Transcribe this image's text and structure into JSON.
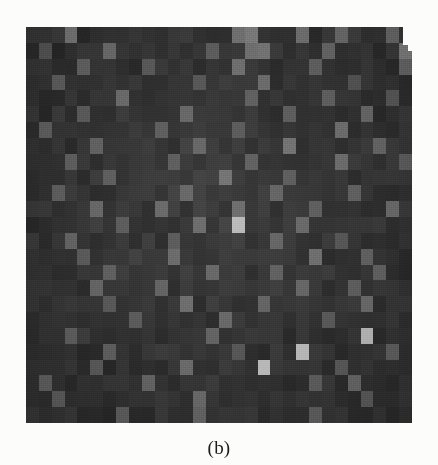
{
  "figure": {
    "caption": "(b)",
    "panel_label": "b",
    "background_color": "#fcfcfa"
  },
  "heatmap": {
    "title": "",
    "xlabel": "",
    "ylabel": "",
    "background_color": "#333333",
    "colormap": "grayscale",
    "panel_left_px": 26,
    "panel_top_px": 27,
    "panel_width_px": 386,
    "panel_height_px": 396
  },
  "chart_data": {
    "type": "heatmap",
    "title": "",
    "subtitle": "",
    "xlabel": "",
    "ylabel": "",
    "grid": false,
    "legend": "none",
    "colormap": "gray",
    "vmin": 0,
    "vmax": 255,
    "n_cols": 30,
    "n_rows": 25,
    "x_tick_labels": [],
    "y_tick_labels": [],
    "annotations": [],
    "note_features": [
      "dark uniform background with scanner grain",
      "scattered mid-gray activation cells",
      "bright descending staircase of 4 cells in lower-right quadrant",
      "white notch cut from the top-right corner of the scanned panel"
    ],
    "values": [
      [
        52,
        50,
        55,
        112,
        48,
        54,
        49,
        51,
        58,
        50,
        47,
        53,
        56,
        49,
        51,
        54,
        112,
        131,
        50,
        48,
        56,
        118,
        49,
        52,
        112,
        58,
        50,
        49,
        111,
        53
      ],
      [
        50,
        92,
        48,
        55,
        51,
        49,
        104,
        52,
        47,
        53,
        50,
        56,
        49,
        51,
        96,
        48,
        53,
        117,
        124,
        51,
        47,
        55,
        50,
        104,
        49,
        53,
        51,
        48,
        55,
        120
      ],
      [
        54,
        48,
        53,
        50,
        106,
        55,
        49,
        51,
        47,
        96,
        52,
        50,
        55,
        48,
        51,
        53,
        110,
        49,
        52,
        47,
        56,
        50,
        98,
        54,
        51,
        48,
        53,
        50,
        49,
        105
      ],
      [
        49,
        56,
        100,
        51,
        48,
        53,
        50,
        47,
        55,
        49,
        52,
        51,
        48,
        94,
        50,
        54,
        49,
        51,
        104,
        48,
        52,
        55,
        50,
        47,
        53,
        92,
        51,
        49,
        54,
        50
      ],
      [
        53,
        50,
        47,
        55,
        51,
        49,
        54,
        108,
        50,
        48,
        52,
        55,
        49,
        51,
        47,
        53,
        50,
        98,
        51,
        54,
        48,
        50,
        55,
        102,
        49,
        51,
        47,
        53,
        96,
        50
      ],
      [
        51,
        48,
        55,
        50,
        94,
        53,
        49,
        51,
        47,
        54,
        50,
        52,
        106,
        48,
        51,
        55,
        49,
        53,
        50,
        47,
        96,
        51,
        48,
        54,
        50,
        52,
        108,
        49,
        51,
        55
      ],
      [
        48,
        104,
        51,
        49,
        54,
        50,
        52,
        47,
        55,
        51,
        98,
        49,
        53,
        50,
        48,
        51,
        94,
        55,
        49,
        52,
        50,
        47,
        53,
        51,
        106,
        48,
        50,
        54,
        49,
        51
      ],
      [
        55,
        49,
        52,
        47,
        51,
        96,
        50,
        53,
        48,
        54,
        51,
        49,
        55,
        102,
        52,
        47,
        50,
        51,
        48,
        54,
        112,
        49,
        53,
        50,
        47,
        51,
        55,
        98,
        52,
        49
      ],
      [
        50,
        53,
        48,
        104,
        55,
        51,
        47,
        49,
        52,
        50,
        54,
        98,
        51,
        48,
        55,
        50,
        49,
        94,
        53,
        51,
        47,
        52,
        50,
        48,
        104,
        55,
        49,
        51,
        53,
        100
      ],
      [
        52,
        47,
        51,
        50,
        48,
        54,
        96,
        51,
        49,
        55,
        50,
        52,
        47,
        53,
        51,
        108,
        48,
        50,
        54,
        49,
        100,
        51,
        55,
        47,
        52,
        50,
        48,
        53,
        51,
        49
      ],
      [
        49,
        51,
        94,
        55,
        52,
        48,
        50,
        47,
        53,
        51,
        49,
        55,
        104,
        50,
        48,
        52,
        51,
        47,
        49,
        96,
        53,
        50,
        55,
        51,
        48,
        106,
        52,
        49,
        50,
        47
      ],
      [
        51,
        55,
        50,
        48,
        53,
        102,
        49,
        52,
        47,
        50,
        96,
        51,
        48,
        55,
        53,
        49,
        110,
        52,
        50,
        47,
        51,
        48,
        98,
        53,
        55,
        50,
        49,
        51,
        104,
        52
      ],
      [
        47,
        50,
        53,
        51,
        49,
        55,
        48,
        96,
        52,
        50,
        51,
        47,
        53,
        108,
        49,
        52,
        190,
        50,
        55,
        48,
        51,
        98,
        50,
        53,
        47,
        49,
        51,
        55,
        50,
        48
      ],
      [
        53,
        48,
        51,
        104,
        50,
        47,
        55,
        51,
        49,
        52,
        48,
        94,
        50,
        51,
        55,
        49,
        53,
        47,
        52,
        106,
        50,
        48,
        51,
        55,
        96,
        52,
        49,
        51,
        47,
        50
      ],
      [
        50,
        52,
        47,
        51,
        98,
        53,
        49,
        50,
        55,
        48,
        51,
        104,
        52,
        47,
        50,
        51,
        49,
        55,
        48,
        53,
        51,
        50,
        110,
        47,
        52,
        49,
        96,
        51,
        55,
        50
      ],
      [
        55,
        49,
        51,
        50,
        52,
        47,
        94,
        53,
        48,
        51,
        49,
        50,
        55,
        52,
        106,
        48,
        51,
        47,
        50,
        96,
        53,
        49,
        52,
        51,
        55,
        50,
        48,
        104,
        51,
        47
      ],
      [
        48,
        51,
        55,
        47,
        50,
        104,
        52,
        49,
        51,
        53,
        98,
        47,
        50,
        55,
        48,
        51,
        52,
        49,
        50,
        53,
        47,
        102,
        51,
        48,
        55,
        96,
        50,
        52,
        49,
        51
      ],
      [
        51,
        50,
        48,
        53,
        47,
        51,
        96,
        55,
        52,
        49,
        50,
        51,
        108,
        48,
        53,
        47,
        50,
        52,
        94,
        51,
        49,
        55,
        50,
        48,
        51,
        53,
        104,
        47,
        52,
        50
      ],
      [
        49,
        55,
        52,
        50,
        51,
        48,
        53,
        47,
        98,
        51,
        52,
        50,
        49,
        55,
        47,
        104,
        51,
        48,
        50,
        53,
        51,
        49,
        52,
        96,
        55,
        50,
        47,
        51,
        49,
        53
      ],
      [
        52,
        47,
        50,
        96,
        55,
        51,
        49,
        50,
        48,
        53,
        47,
        51,
        52,
        50,
        108,
        49,
        55,
        51,
        47,
        50,
        48,
        51,
        53,
        49,
        50,
        52,
        190,
        47,
        51,
        55
      ],
      [
        50,
        51,
        49,
        52,
        47,
        50,
        104,
        48,
        51,
        55,
        53,
        49,
        50,
        47,
        51,
        52,
        96,
        50,
        48,
        53,
        51,
        190,
        55,
        47,
        49,
        52,
        50,
        51,
        106,
        48
      ],
      [
        53,
        48,
        55,
        51,
        50,
        98,
        47,
        52,
        49,
        51,
        50,
        53,
        104,
        51,
        48,
        55,
        47,
        50,
        190,
        52,
        49,
        51,
        50,
        47,
        96,
        53,
        51,
        55,
        50,
        49
      ],
      [
        51,
        104,
        50,
        47,
        52,
        51,
        49,
        55,
        50,
        96,
        48,
        51,
        52,
        47,
        53,
        50,
        49,
        51,
        55,
        48,
        50,
        52,
        102,
        51,
        47,
        98,
        50,
        53,
        49,
        51
      ],
      [
        47,
        50,
        96,
        53,
        51,
        49,
        50,
        48,
        55,
        52,
        51,
        47,
        50,
        104,
        49,
        51,
        55,
        50,
        48,
        52,
        51,
        53,
        47,
        50,
        51,
        49,
        96,
        52,
        50,
        55
      ],
      [
        50,
        51,
        48,
        55,
        50,
        52,
        47,
        98,
        51,
        49,
        53,
        50,
        51,
        104,
        47,
        52,
        50,
        55,
        49,
        51,
        48,
        50,
        96,
        53,
        51,
        47,
        52,
        49,
        51,
        50
      ]
    ]
  }
}
